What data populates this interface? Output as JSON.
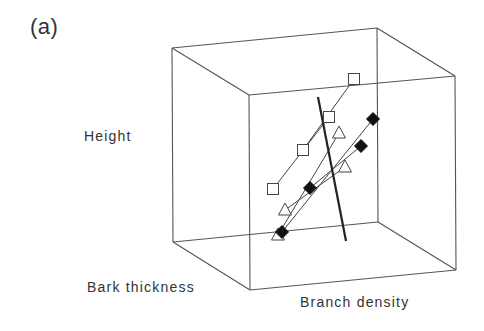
{
  "figure": {
    "panel_label": "(a)",
    "axes": {
      "vertical": "Height",
      "depth": "Bark thickness",
      "horizontal": "Branch density"
    }
  },
  "cube": {
    "stroke": "#555555",
    "corners": {
      "back_top_left": [
        172,
        48
      ],
      "back_top_right": [
        377,
        28
      ],
      "front_top_left": [
        249,
        95
      ],
      "front_top_right": [
        455,
        76
      ],
      "back_bottom_left": [
        173,
        242
      ],
      "back_bottom_right": [
        378,
        222
      ],
      "front_bottom_left": [
        250,
        290
      ],
      "front_bottom_right": [
        456,
        270
      ]
    }
  },
  "separator_line": {
    "from": [
      318,
      97
    ],
    "to": [
      346,
      241
    ],
    "color": "#222222",
    "width": 2.2
  },
  "series": [
    {
      "name": "open-square",
      "marker": "square",
      "fill": "#ffffff",
      "stroke": "#444444",
      "points": [
        [
          354,
          79
        ],
        [
          329,
          117
        ],
        [
          303,
          150
        ],
        [
          273,
          189
        ]
      ],
      "links": [
        [
          [
            354,
            79
          ],
          [
            303,
            150
          ]
        ],
        [
          [
            329,
            117
          ],
          [
            273,
            189
          ]
        ]
      ]
    },
    {
      "name": "open-triangle",
      "marker": "triangle",
      "fill": "#ffffff",
      "stroke": "#444444",
      "points": [
        [
          339,
          133
        ],
        [
          345,
          167
        ],
        [
          285,
          210
        ],
        [
          278,
          235
        ]
      ],
      "links": [
        [
          [
            339,
            133
          ],
          [
            278,
            235
          ]
        ],
        [
          [
            345,
            167
          ],
          [
            285,
            210
          ]
        ]
      ]
    },
    {
      "name": "filled-diamond",
      "marker": "diamond",
      "fill": "#111111",
      "stroke": "#111111",
      "points": [
        [
          373,
          119
        ],
        [
          361,
          146
        ],
        [
          310,
          188
        ],
        [
          282,
          232
        ]
      ],
      "links": [
        [
          [
            373,
            119
          ],
          [
            282,
            232
          ]
        ],
        [
          [
            361,
            146
          ],
          [
            310,
            188
          ]
        ]
      ]
    }
  ]
}
